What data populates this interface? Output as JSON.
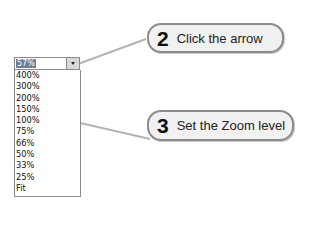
{
  "zoom_combo": {
    "value": "57%",
    "options": [
      "400%",
      "300%",
      "200%",
      "150%",
      "100%",
      "75%",
      "66%",
      "50%",
      "33%",
      "25%",
      "Fit"
    ]
  },
  "callouts": [
    {
      "number": "2",
      "text": "Click the arrow"
    },
    {
      "number": "3",
      "text": "Set the Zoom level"
    }
  ],
  "colors": {
    "callout_border": "#8c8c8c",
    "callout_fill": "#f1f1f1",
    "selection": "#6b7f96",
    "connector": "#b4b4b4"
  }
}
